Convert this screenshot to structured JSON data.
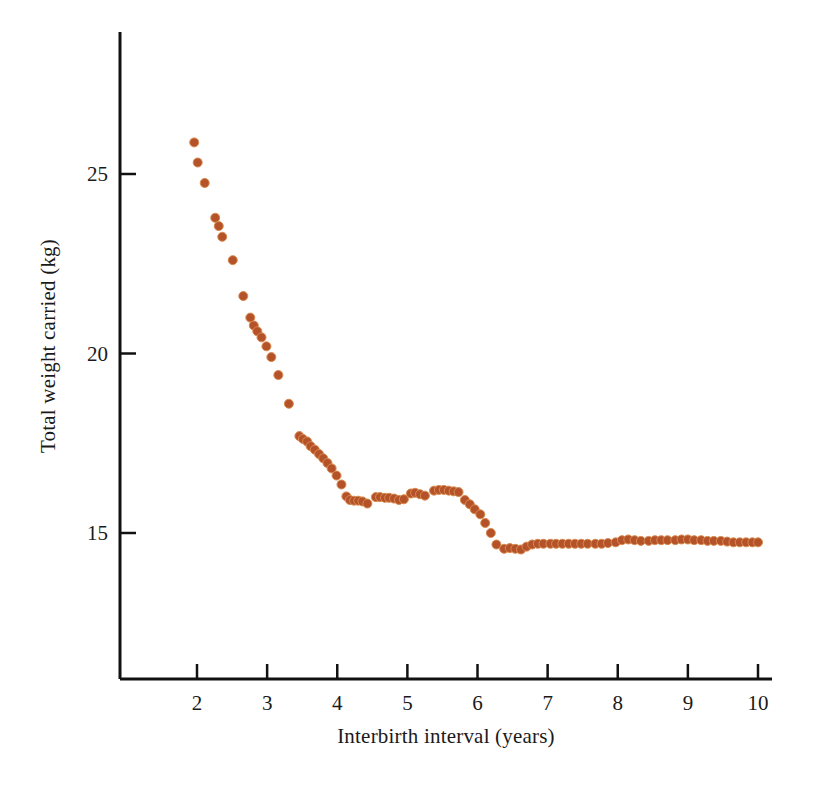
{
  "chart_data": {
    "type": "scatter",
    "title": "",
    "subtitle": "",
    "xlabel": "Interbirth interval (years)",
    "ylabel": "Total weight carried (kg)",
    "xlim": [
      1.25,
      10.15
    ],
    "ylim": [
      11.6,
      26.8
    ],
    "xticks": [
      2,
      3,
      4,
      5,
      6,
      7,
      8,
      9,
      10
    ],
    "yticks": [
      15,
      20,
      25
    ],
    "xtick_labels": [
      "2",
      "3",
      "4",
      "5",
      "6",
      "7",
      "8",
      "9",
      "10"
    ],
    "ytick_labels": [
      "15",
      "20",
      "25"
    ],
    "grid": false,
    "legend": null,
    "marker": {
      "shape": "circle",
      "color": "#b4532a",
      "edge_color": "#d98a4e",
      "size_px": 9
    },
    "annotations": [],
    "series": [
      {
        "name": "Total weight carried vs interbirth interval",
        "color": "#b4532a",
        "points": [
          [
            1.96,
            25.88
          ],
          [
            2.01,
            25.32
          ],
          [
            2.11,
            24.75
          ],
          [
            2.26,
            23.78
          ],
          [
            2.31,
            23.55
          ],
          [
            2.36,
            23.25
          ],
          [
            2.51,
            22.6
          ],
          [
            2.66,
            21.6
          ],
          [
            2.76,
            21.0
          ],
          [
            2.81,
            20.78
          ],
          [
            2.86,
            20.62
          ],
          [
            2.92,
            20.45
          ],
          [
            2.99,
            20.2
          ],
          [
            3.06,
            19.9
          ],
          [
            3.16,
            19.4
          ],
          [
            3.31,
            18.6
          ],
          [
            3.46,
            17.7
          ],
          [
            3.51,
            17.62
          ],
          [
            3.57,
            17.55
          ],
          [
            3.62,
            17.42
          ],
          [
            3.68,
            17.32
          ],
          [
            3.74,
            17.2
          ],
          [
            3.8,
            17.08
          ],
          [
            3.86,
            16.95
          ],
          [
            3.92,
            16.8
          ],
          [
            3.99,
            16.6
          ],
          [
            4.06,
            16.35
          ],
          [
            4.13,
            16.02
          ],
          [
            4.18,
            15.92
          ],
          [
            4.24,
            15.9
          ],
          [
            4.3,
            15.9
          ],
          [
            4.36,
            15.88
          ],
          [
            4.43,
            15.82
          ],
          [
            4.55,
            16.0
          ],
          [
            4.61,
            16.0
          ],
          [
            4.68,
            15.98
          ],
          [
            4.74,
            15.98
          ],
          [
            4.81,
            15.96
          ],
          [
            4.88,
            15.92
          ],
          [
            4.95,
            15.94
          ],
          [
            5.05,
            16.1
          ],
          [
            5.11,
            16.12
          ],
          [
            5.18,
            16.08
          ],
          [
            5.25,
            16.04
          ],
          [
            5.38,
            16.18
          ],
          [
            5.45,
            16.2
          ],
          [
            5.52,
            16.2
          ],
          [
            5.59,
            16.18
          ],
          [
            5.66,
            16.16
          ],
          [
            5.73,
            16.14
          ],
          [
            5.82,
            15.92
          ],
          [
            5.89,
            15.8
          ],
          [
            5.96,
            15.66
          ],
          [
            6.04,
            15.52
          ],
          [
            6.11,
            15.28
          ],
          [
            6.19,
            15.0
          ],
          [
            6.27,
            14.68
          ],
          [
            6.38,
            14.56
          ],
          [
            6.46,
            14.58
          ],
          [
            6.54,
            14.56
          ],
          [
            6.62,
            14.54
          ],
          [
            6.7,
            14.62
          ],
          [
            6.78,
            14.68
          ],
          [
            6.86,
            14.7
          ],
          [
            6.94,
            14.7
          ],
          [
            7.04,
            14.7
          ],
          [
            7.12,
            14.7
          ],
          [
            7.21,
            14.7
          ],
          [
            7.3,
            14.7
          ],
          [
            7.39,
            14.7
          ],
          [
            7.48,
            14.7
          ],
          [
            7.57,
            14.7
          ],
          [
            7.68,
            14.7
          ],
          [
            7.77,
            14.7
          ],
          [
            7.86,
            14.72
          ],
          [
            7.97,
            14.74
          ],
          [
            8.06,
            14.8
          ],
          [
            8.15,
            14.82
          ],
          [
            8.24,
            14.8
          ],
          [
            8.33,
            14.78
          ],
          [
            8.44,
            14.78
          ],
          [
            8.53,
            14.8
          ],
          [
            8.62,
            14.8
          ],
          [
            8.71,
            14.8
          ],
          [
            8.82,
            14.8
          ],
          [
            8.91,
            14.82
          ],
          [
            9.0,
            14.82
          ],
          [
            9.09,
            14.8
          ],
          [
            9.19,
            14.8
          ],
          [
            9.28,
            14.78
          ],
          [
            9.37,
            14.78
          ],
          [
            9.47,
            14.78
          ],
          [
            9.56,
            14.76
          ],
          [
            9.65,
            14.74
          ],
          [
            9.74,
            14.74
          ],
          [
            9.83,
            14.74
          ],
          [
            9.92,
            14.74
          ],
          [
            10.0,
            14.74
          ]
        ]
      }
    ]
  },
  "axes": {
    "color": "#111111",
    "line_width_px": 3
  }
}
